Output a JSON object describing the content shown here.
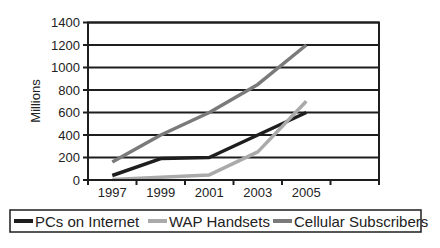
{
  "chart_data": {
    "type": "line",
    "title": "",
    "xlabel": "",
    "ylabel": "Millions",
    "categories": [
      "1997",
      "1999",
      "2001",
      "2003",
      "2005",
      ""
    ],
    "ylim": [
      0,
      1400
    ],
    "yticks": [
      0,
      200,
      400,
      600,
      800,
      1000,
      1200,
      1400
    ],
    "grid": true,
    "legend_position": "bottom",
    "series": [
      {
        "name": "PCs on Internet",
        "color": "#1e1e1e",
        "values": [
          40,
          190,
          200,
          400,
          600,
          null
        ]
      },
      {
        "name": "WAP Handsets",
        "color": "#aaaaaa",
        "values": [
          5,
          25,
          45,
          250,
          700,
          null
        ]
      },
      {
        "name": "Cellular Subscribers",
        "color": "#7a7a7a",
        "values": [
          160,
          400,
          600,
          850,
          1200,
          null
        ]
      }
    ]
  }
}
